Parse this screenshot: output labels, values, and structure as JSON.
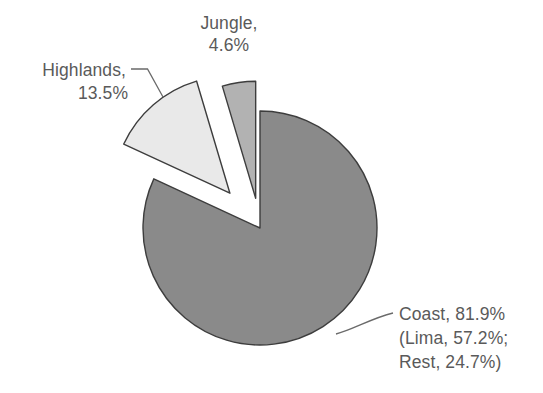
{
  "chart_data": {
    "type": "pie",
    "title": "",
    "subtitle": "",
    "xlabel": "",
    "ylabel": "",
    "legend_position": "none",
    "grid": false,
    "units": "percent",
    "categories": [
      "Coast",
      "Highlands",
      "Jungle"
    ],
    "values": [
      81.9,
      13.5,
      4.6
    ],
    "slices": [
      {
        "name": "Coast",
        "value": 81.9,
        "color": "#8a8a8a",
        "exploded": false,
        "label_lines": [
          "Coast, 81.9%",
          "(Lima, 57.2%;",
          "Rest, 24.7%)"
        ],
        "subcomponents": [
          {
            "name": "Lima",
            "value": 57.2
          },
          {
            "name": "Rest",
            "value": 24.7
          }
        ]
      },
      {
        "name": "Highlands",
        "value": 13.5,
        "color": "#e9e9e9",
        "exploded": true,
        "label_lines": [
          "Highlands,",
          "13.5%"
        ],
        "subcomponents": []
      },
      {
        "name": "Jungle",
        "value": 4.6,
        "color": "#b2b2b2",
        "exploded": true,
        "label_lines": [
          "Jungle,",
          "4.6%"
        ],
        "subcomponents": []
      }
    ]
  },
  "labels": {
    "jungle": {
      "line1": "Jungle,",
      "line2": "4.6%"
    },
    "highlands": {
      "line1": "Highlands,",
      "line2": "13.5%"
    },
    "coast": {
      "line1": "Coast, 81.9%",
      "line2": "(Lima, 57.2%;",
      "line3": "Rest, 24.7%)"
    }
  },
  "colors": {
    "coast_fill": "#8a8a8a",
    "highlands_fill": "#e9e9e9",
    "jungle_fill": "#b2b2b2",
    "outline": "#3d3d3d",
    "text": "#5a5a5a",
    "leader": "#6a6a6a",
    "background": "#ffffff"
  }
}
